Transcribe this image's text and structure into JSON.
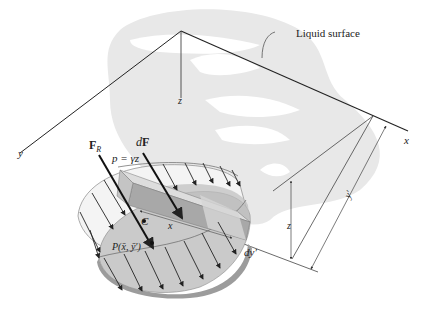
{
  "figure": {
    "colors": {
      "background": "#ffffff",
      "watermark": "#e6e6e6",
      "line": "#222222",
      "plate_face": "#c9c9c9",
      "plate_edge": "#9a9a9a",
      "pressure_envelope": "#f2f2f2",
      "strip": "#b3b3b3"
    }
  },
  "labels": {
    "liquid_surface": "Liquid surface",
    "axis_x": "x",
    "axis_y": "y",
    "axis_z": "z",
    "resultant_force": "F",
    "resultant_force_sub": "R",
    "differential_force_d": "d",
    "differential_force_F": "F",
    "pressure_eq": "p = γz",
    "centroid": "C",
    "center_of_pressure": "P(x̄, ȳ′)",
    "strip_x": "x",
    "strip_width": "dy′",
    "depth_z": "z",
    "distance_y_prime": "y′"
  }
}
